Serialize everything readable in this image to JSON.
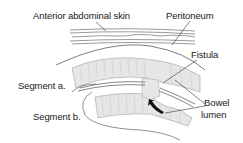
{
  "diagram": {
    "type": "anatomical-illustration",
    "labels": {
      "skin": "Anterior abdominal skin",
      "peritoneum": "Peritoneum",
      "fistula": "Fistula",
      "segment_a": "Segment a.",
      "segment_b": "Segment b.",
      "bowel_lumen_line1": "Bowel",
      "bowel_lumen_line2": "lumen"
    },
    "colors": {
      "line": "#3a3a3a",
      "bowel_fill": "#e6e6e6",
      "bowel_edge": "#9a9a9a",
      "arrow": "#111111",
      "text": "#1a1a1a"
    }
  }
}
